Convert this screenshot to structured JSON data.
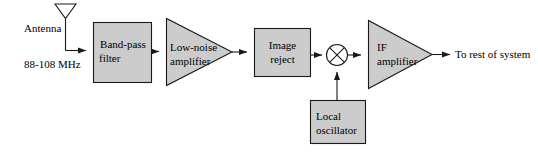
{
  "diagram": {
    "colors": {
      "block_fill": "#cccccc",
      "stroke": "#1a1a1a",
      "background": "#ffffff",
      "text": "#000000"
    },
    "antenna": {
      "label": "Antenna",
      "icon": "antenna-icon"
    },
    "input_signal": {
      "label": "88-108 MHz"
    },
    "blocks": [
      {
        "id": "band_pass_filter",
        "shape": "rect",
        "line1": "Band-pass",
        "line2": "filter"
      },
      {
        "id": "low_noise_amplifier",
        "shape": "triangle",
        "line1": "Low-noise",
        "line2": "amplifier"
      },
      {
        "id": "image_reject",
        "shape": "rect",
        "line1": "Image",
        "line2": "reject"
      },
      {
        "id": "mixer",
        "shape": "circle-x",
        "line1": "",
        "line2": ""
      },
      {
        "id": "if_amplifier",
        "shape": "triangle",
        "line1": "IF",
        "line2": "amplifier"
      },
      {
        "id": "local_oscillator",
        "shape": "rect",
        "line1": "Local",
        "line2": "oscillator"
      }
    ],
    "output": {
      "label": "To rest of system"
    }
  }
}
